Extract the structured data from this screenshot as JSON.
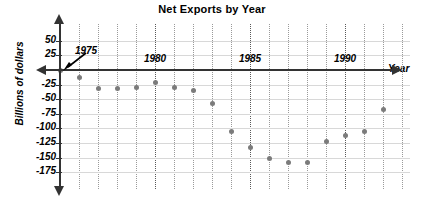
{
  "chart_data": {
    "type": "scatter",
    "title": "Net Exports by Year",
    "xlabel": "Year",
    "ylabel": "Billions of dollars",
    "grid": true,
    "legend": "none",
    "xlim": [
      1974,
      1993
    ],
    "ylim": [
      -175,
      50
    ],
    "x_tick_labels": [
      "1975",
      "1980",
      "1985",
      "1990"
    ],
    "x_tick_values": [
      1975,
      1980,
      1985,
      1990
    ],
    "y_tick_labels": [
      "50",
      "25",
      "-25",
      "-50",
      "-75",
      "-100",
      "-125",
      "-150",
      "-175"
    ],
    "y_tick_values": [
      50,
      25,
      -25,
      -50,
      -75,
      -100,
      -125,
      -150,
      -175
    ],
    "point_color": "#7b7b7b",
    "axis_color": "#333333",
    "grid_color": "#9a9a9a",
    "annotation": "1975",
    "x": [
      1975,
      1976,
      1977,
      1978,
      1979,
      1980,
      1981,
      1982,
      1983,
      1984,
      1985,
      1986,
      1987,
      1988,
      1989,
      1990,
      1991,
      1992
    ],
    "values": [
      0,
      -12,
      -32,
      -32,
      -30,
      -22,
      -30,
      -35,
      -58,
      -105,
      -133,
      -152,
      -158,
      -158,
      -122,
      -113,
      -106,
      -68
    ],
    "units": "Billions of dollars"
  },
  "axis": {
    "x_title": "Year",
    "y_title": "Billions of dollars"
  }
}
